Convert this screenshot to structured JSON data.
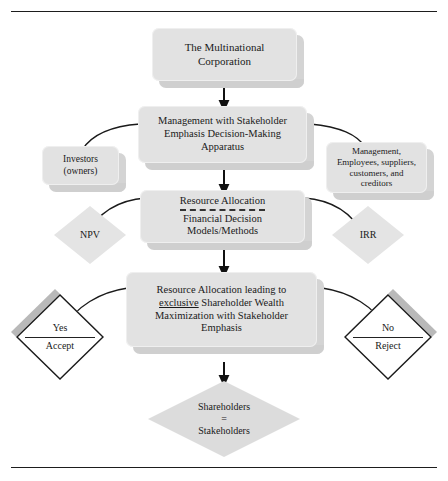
{
  "figure": {
    "colors": {
      "box_fill": "#e2e2e2",
      "box_shadow": "#cfcfcf",
      "diamond_fill": "#e4e4e4",
      "line": "#1a1a1a",
      "rule": "#1d1d1d"
    }
  },
  "nodes": {
    "corporation": {
      "line1": "The Multinational",
      "line2": "Corporation"
    },
    "management": {
      "line1": "Management with Stakeholder",
      "line2": "Emphasis Decision-Making",
      "line3": "Apparatus"
    },
    "investors": {
      "line1": "Investors",
      "line2": "(owners)"
    },
    "stakeholders_group": {
      "line1": "Management,",
      "line2": "Employees, suppliers,",
      "line3": "customers, and",
      "line4": "creditors"
    },
    "resource_allocation": {
      "line1": "Resource Allocation",
      "line2": "Financial Decision",
      "line3": "Models/Methods"
    },
    "npv": {
      "label": "NPV"
    },
    "irr": {
      "label": "IRR"
    },
    "wealth_maximization": {
      "line1": "Resource Allocation leading to",
      "line2_pre": "",
      "line2_underlined": "exclusive",
      "line2_post": " Shareholder Wealth",
      "line3": "Maximization with Stakeholder",
      "line4": "Emphasis"
    },
    "accept": {
      "line1": "Yes",
      "line2": "Accept"
    },
    "reject": {
      "line1": "No",
      "line2": "Reject"
    },
    "shareholders_equal": {
      "line1": "Shareholders",
      "line2": "=",
      "line3": "Stakeholders"
    }
  }
}
